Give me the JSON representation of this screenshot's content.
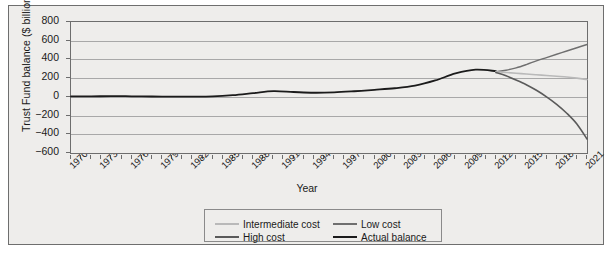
{
  "chart_data": {
    "type": "line",
    "title": "",
    "xlabel": "Year",
    "ylabel": "Trust Fund balance ($ billions)",
    "xlim": [
      1970,
      2021
    ],
    "ylim": [
      -600,
      800
    ],
    "ytick_labels": [
      "800",
      "600",
      "400",
      "200",
      "0",
      "−200",
      "−400",
      "−600"
    ],
    "ytick_values": [
      800,
      600,
      400,
      200,
      0,
      -200,
      -400,
      -600
    ],
    "xtick_labels": [
      "1970",
      "1973",
      "1976",
      "1979",
      "1982",
      "1985",
      "1988",
      "1991",
      "1994",
      "1997",
      "2000",
      "2003",
      "2006",
      "2009",
      "2012",
      "2015",
      "2018",
      "2021"
    ],
    "xtick_values": [
      1970,
      1973,
      1976,
      1979,
      1982,
      1985,
      1988,
      1991,
      1994,
      1997,
      2000,
      2003,
      2006,
      2009,
      2012,
      2015,
      2018,
      2021
    ],
    "grid": true,
    "legend_position": "bottom-center",
    "series": [
      {
        "name": "Actual balance",
        "color": "#1b1b1b",
        "width": 1.8,
        "x": [
          1970,
          1972,
          1974,
          1976,
          1978,
          1980,
          1982,
          1984,
          1986,
          1988,
          1990,
          1992,
          1994,
          1996,
          1998,
          2000,
          2002,
          2004,
          2006,
          2008,
          2010,
          2012
        ],
        "values": [
          5,
          5,
          8,
          6,
          4,
          2,
          2,
          5,
          18,
          40,
          62,
          52,
          44,
          48,
          60,
          75,
          92,
          120,
          175,
          250,
          290,
          275
        ]
      },
      {
        "name": "Low cost",
        "color": "#6f6f6f",
        "width": 1.4,
        "x": [
          2012,
          2013,
          2014,
          2015,
          2016,
          2017,
          2018,
          2019,
          2020,
          2021
        ],
        "values": [
          270,
          285,
          310,
          345,
          385,
          420,
          455,
          490,
          525,
          560
        ]
      },
      {
        "name": "Intermediate cost",
        "color": "#b9b9b9",
        "width": 1.6,
        "x": [
          2012,
          2013,
          2014,
          2015,
          2016,
          2017,
          2018,
          2019,
          2020,
          2021
        ],
        "values": [
          268,
          260,
          252,
          244,
          236,
          228,
          220,
          212,
          200,
          185
        ]
      },
      {
        "name": "High cost",
        "color": "#5a5a5a",
        "width": 1.6,
        "x": [
          2012,
          2013,
          2014,
          2015,
          2016,
          2017,
          2018,
          2019,
          2020,
          2021
        ],
        "values": [
          260,
          225,
          180,
          130,
          70,
          0,
          -80,
          -175,
          -290,
          -450
        ]
      }
    ],
    "legend": [
      {
        "label": "Intermediate cost",
        "color": "#b9b9b9"
      },
      {
        "label": "Low cost",
        "color": "#6f6f6f"
      },
      {
        "label": "High cost",
        "color": "#5a5a5a"
      },
      {
        "label": "Actual balance",
        "color": "#1b1b1b"
      }
    ]
  }
}
